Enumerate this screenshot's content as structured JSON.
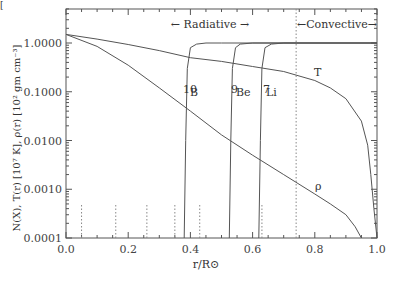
{
  "chart_data": {
    "type": "line",
    "title": "",
    "xlabel": "r/R⊙",
    "ylabel": "N(X), T(r) [10⁷ K], ρ(r) [10² gm cm⁻³]",
    "xlim": [
      0.0,
      1.0
    ],
    "ylim": [
      0.0001,
      5.0
    ],
    "yscale": "log",
    "grid": false,
    "x_ticks": [
      "0.0",
      "0.2",
      "0.4",
      "0.6",
      "0.8",
      "1.0"
    ],
    "y_ticks": [
      "1.0000",
      "0.1000",
      "0.0100",
      "0.0010",
      "0.0001"
    ],
    "annotations": {
      "radiative": "← Radiative →",
      "convective": "←Convective→",
      "T_label": "T",
      "rho_label": "ρ",
      "B_label": "B",
      "B_mass": "10",
      "Be_label": "Be",
      "Be_mass": "9",
      "Li_label": "Li",
      "Li_mass": "7"
    },
    "convective_boundary": 0.74,
    "dotted_markers_x": [
      0.05,
      0.16,
      0.26,
      0.35,
      0.43,
      0.63
    ],
    "series": [
      {
        "name": "T",
        "x": [
          0.0,
          0.1,
          0.2,
          0.3,
          0.4,
          0.5,
          0.6,
          0.7,
          0.74,
          0.8,
          0.85,
          0.9,
          0.95,
          0.97,
          0.98,
          0.99,
          1.0
        ],
        "y": [
          1.5,
          1.2,
          0.93,
          0.7,
          0.5,
          0.42,
          0.33,
          0.26,
          0.22,
          0.17,
          0.12,
          0.072,
          0.025,
          0.008,
          0.002,
          0.0004,
          0.0001
        ]
      },
      {
        "name": "rho",
        "x": [
          0.0,
          0.1,
          0.2,
          0.3,
          0.4,
          0.5,
          0.6,
          0.7,
          0.8,
          0.85,
          0.9,
          0.93,
          0.95
        ],
        "y": [
          1.5,
          0.85,
          0.35,
          0.12,
          0.04,
          0.013,
          0.005,
          0.002,
          0.0008,
          0.0005,
          0.0003,
          0.00017,
          0.0001
        ]
      },
      {
        "name": "10B",
        "x": [
          0.38,
          0.385,
          0.39,
          0.4,
          0.42,
          0.45,
          0.5,
          0.74,
          1.0
        ],
        "y": [
          0.0001,
          0.01,
          0.3,
          0.8,
          0.95,
          1.0,
          1.0,
          1.0,
          1.0
        ]
      },
      {
        "name": "9Be",
        "x": [
          0.525,
          0.53,
          0.535,
          0.545,
          0.56,
          0.6,
          0.74,
          1.0
        ],
        "y": [
          0.0001,
          0.01,
          0.3,
          0.8,
          0.95,
          1.0,
          1.0,
          1.0
        ]
      },
      {
        "name": "7Li",
        "x": [
          0.62,
          0.625,
          0.63,
          0.64,
          0.66,
          0.7,
          0.74,
          1.0
        ],
        "y": [
          0.0001,
          0.01,
          0.3,
          0.8,
          0.95,
          1.0,
          1.0,
          1.0
        ]
      }
    ]
  },
  "figure": {
    "corner_mark": "["
  }
}
